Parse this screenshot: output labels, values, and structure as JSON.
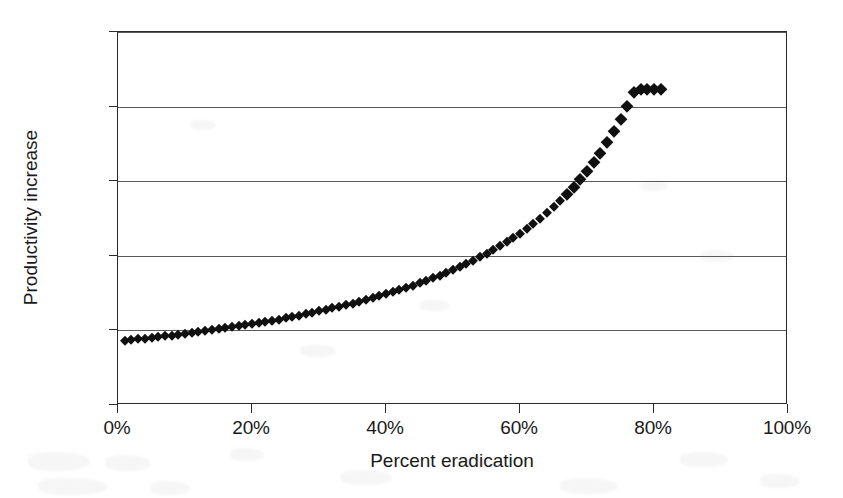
{
  "chart_data": {
    "type": "scatter",
    "title": "",
    "xlabel": "Percent eradication",
    "ylabel": "Productivity increase",
    "xlim": [
      0,
      100
    ],
    "ylim": [
      0,
      2.5
    ],
    "x_tick_labels": [
      "0%",
      "20%",
      "40%",
      "60%",
      "80%",
      "100%"
    ],
    "x_ticks": [
      0,
      20,
      40,
      60,
      80,
      100
    ],
    "y_tick_labels": [
      "0.0%",
      "0.5%",
      "1.0%",
      "1.5%",
      "2.0%",
      "2.5%"
    ],
    "y_ticks": [
      0.0,
      0.5,
      1.0,
      1.5,
      2.0,
      2.5
    ],
    "grid": "horizontal",
    "legend": "none",
    "marker": "diamond",
    "marker_color": "#101010",
    "series": [
      {
        "name": "Productivity increase vs percent eradication",
        "x": [
          1,
          2,
          3,
          4,
          5,
          6,
          7,
          8,
          9,
          10,
          11,
          12,
          13,
          14,
          15,
          16,
          17,
          18,
          19,
          20,
          21,
          22,
          23,
          24,
          25,
          26,
          27,
          28,
          29,
          30,
          31,
          32,
          33,
          34,
          35,
          36,
          37,
          38,
          39,
          40,
          41,
          42,
          43,
          44,
          45,
          46,
          47,
          48,
          49,
          50,
          51,
          52,
          53,
          54,
          55,
          56,
          57,
          58,
          59,
          60,
          61,
          62,
          63,
          64,
          65,
          66,
          67,
          68,
          69,
          70,
          71,
          72,
          73,
          74,
          75,
          76,
          77,
          78,
          79,
          80,
          81
        ],
        "y": [
          0.43,
          0.435,
          0.44,
          0.445,
          0.45,
          0.455,
          0.46,
          0.465,
          0.47,
          0.475,
          0.48,
          0.487,
          0.493,
          0.5,
          0.507,
          0.513,
          0.52,
          0.527,
          0.534,
          0.541,
          0.549,
          0.557,
          0.565,
          0.573,
          0.581,
          0.59,
          0.599,
          0.608,
          0.617,
          0.627,
          0.637,
          0.647,
          0.658,
          0.669,
          0.68,
          0.692,
          0.704,
          0.716,
          0.729,
          0.742,
          0.756,
          0.77,
          0.785,
          0.8,
          0.816,
          0.832,
          0.849,
          0.867,
          0.885,
          0.904,
          0.924,
          0.945,
          0.966,
          0.989,
          1.012,
          1.037,
          1.063,
          1.09,
          1.118,
          1.148,
          1.18,
          1.213,
          1.248,
          1.286,
          1.325,
          1.368,
          1.413,
          1.461,
          1.513,
          1.568,
          1.628,
          1.692,
          1.761,
          1.835,
          1.915,
          2.002,
          2.095,
          2.12,
          2.12,
          2.12,
          2.12
        ]
      }
    ]
  },
  "axis": {
    "y_title": "Productivity increase",
    "x_title": "Percent eradication"
  }
}
